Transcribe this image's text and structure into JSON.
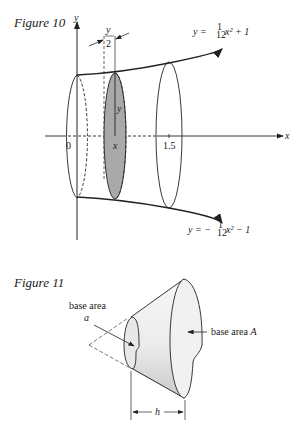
{
  "figure10": {
    "caption": "Figure 10",
    "y_axis_label": "y",
    "x_axis_label": "x",
    "tick_0": "0",
    "tick_x": "x",
    "tick_15": "1.5",
    "radius_label": "y",
    "thickness_num": "y",
    "thickness_den": "2",
    "upper_curve": {
      "lhs": "y = ",
      "num": "1",
      "den": "12",
      "rest": "x² + 1"
    },
    "lower_curve": {
      "lhs": "y = −",
      "num": "1",
      "den": "12",
      "rest": "x² − 1"
    },
    "colors": {
      "slice": "#a9a9a9",
      "line": "#222222"
    }
  },
  "figure11": {
    "caption": "Figure 11",
    "small_base_label": "base area",
    "small_base_var": "a",
    "large_base_label": "base area ",
    "large_base_var": "A",
    "height_label": "h",
    "colors": {
      "fill_light": "#f4f4f4",
      "fill_dark": "#cfcfcf"
    }
  }
}
